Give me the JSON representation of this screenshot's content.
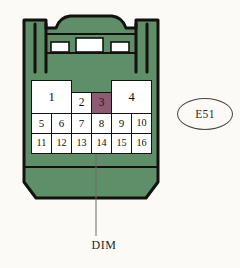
{
  "diagram": {
    "type": "connector-pinout",
    "title": "E51",
    "body_color": "#5f8f68",
    "outline_color": "#14110f",
    "background_color": "#fbfaf7",
    "highlight_color": "#8e5c72",
    "pin_fill_color": "#ffffff"
  },
  "connector": {
    "name": "connector-body",
    "latch": {
      "name": "top-latch",
      "blocks": [
        "latch-block-left",
        "latch-block-center",
        "latch-block-right"
      ]
    },
    "ribs": [
      "left-rib",
      "right-rib"
    ]
  },
  "pins": {
    "top_row": [
      {
        "number": "1",
        "span": 2,
        "highlighted": false
      },
      {
        "number": "2",
        "span": 1,
        "highlighted": false
      },
      {
        "number": "3",
        "span": 1,
        "highlighted": true
      },
      {
        "number": "4",
        "span": 2,
        "highlighted": false
      }
    ],
    "middle_row": [
      {
        "number": "5",
        "highlighted": false
      },
      {
        "number": "6",
        "highlighted": false
      },
      {
        "number": "7",
        "highlighted": false
      },
      {
        "number": "8",
        "highlighted": false
      },
      {
        "number": "9",
        "highlighted": false
      },
      {
        "number": "10",
        "highlighted": false
      }
    ],
    "bottom_row": [
      {
        "number": "11",
        "highlighted": false
      },
      {
        "number": "12",
        "highlighted": false
      },
      {
        "number": "13",
        "highlighted": false
      },
      {
        "number": "14",
        "highlighted": false
      },
      {
        "number": "15",
        "highlighted": false
      },
      {
        "number": "16",
        "highlighted": false
      }
    ]
  },
  "callout": {
    "connector_id": "E51"
  },
  "annotation": {
    "signal_label": "DIM",
    "points_to_pin": "3"
  }
}
